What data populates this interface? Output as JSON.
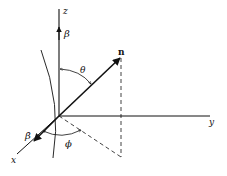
{
  "diagram": {
    "colors": {
      "stroke": "#111111",
      "background": "#ffffff"
    },
    "labels": {
      "z_axis": "z",
      "y_axis": "y",
      "x_axis": "x",
      "beta": "β",
      "beta_dot": "β̇",
      "n_vector": "n",
      "theta": "θ",
      "phi": "ϕ"
    }
  }
}
